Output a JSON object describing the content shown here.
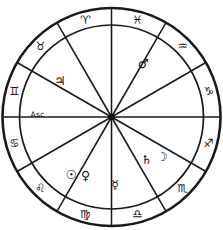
{
  "diagram": {
    "type": "zodiac-wheel",
    "center": {
      "x": 111.5,
      "y": 117,
      "hub_radius": 3.2
    },
    "radii": {
      "outer": 109,
      "inner_ring": 92,
      "sign_label": 100.5
    },
    "house_count": 12,
    "sign_count": 12,
    "colors": {
      "stroke": "#1a1a1a",
      "fill": "#ffffff",
      "glyph": "#111111"
    },
    "ring_rotation_offset_deg": 15
  },
  "signs": [
    {
      "name": "Pisces",
      "glyph": "♓",
      "angle_deg": -75,
      "label_angle_deg": -75
    },
    {
      "name": "Aquarius",
      "glyph": "♒",
      "angle_deg": -45,
      "label_angle_deg": -45
    },
    {
      "name": "Capricorn",
      "glyph": "♑",
      "angle_deg": -15,
      "label_angle_deg": -15
    },
    {
      "name": "Sagittarius",
      "glyph": "♐",
      "angle_deg": 15,
      "label_angle_deg": 15
    },
    {
      "name": "Scorpio",
      "glyph": "♏",
      "angle_deg": 45,
      "label_angle_deg": 45
    },
    {
      "name": "Libra",
      "glyph": "♎",
      "angle_deg": 75,
      "label_angle_deg": 75
    },
    {
      "name": "Virgo",
      "glyph": "♍",
      "angle_deg": 105,
      "label_angle_deg": 105
    },
    {
      "name": "Leo",
      "glyph": "♌",
      "angle_deg": 135,
      "label_angle_deg": 135
    },
    {
      "name": "Cancer",
      "glyph": "♋",
      "angle_deg": 165,
      "label_angle_deg": 165
    },
    {
      "name": "Gemini",
      "glyph": "♊",
      "angle_deg": 195,
      "label_angle_deg": 195
    },
    {
      "name": "Taurus",
      "glyph": "♉",
      "angle_deg": 225,
      "label_angle_deg": 225
    },
    {
      "name": "Aries",
      "glyph": "♈",
      "angle_deg": 255,
      "label_angle_deg": 255
    }
  ],
  "planets": [
    {
      "name": "Mars",
      "glyph": "♂",
      "angle_deg": -59,
      "radius": 62
    },
    {
      "name": "Moon",
      "glyph": "☽",
      "angle_deg": 38,
      "radius": 64
    },
    {
      "name": "Saturn",
      "glyph": "♄",
      "angle_deg": 50,
      "radius": 55
    },
    {
      "name": "Mercury",
      "glyph": "☿",
      "angle_deg": 87,
      "radius": 68
    },
    {
      "name": "Venus",
      "glyph": "♀",
      "angle_deg": 114,
      "radius": 64
    },
    {
      "name": "Sun",
      "glyph": "☉",
      "angle_deg": 125,
      "radius": 70
    },
    {
      "name": "Jupiter",
      "glyph": "♃",
      "angle_deg": 215,
      "radius": 63
    }
  ],
  "points": [
    {
      "name": "Ascendant",
      "label": "Asc",
      "angle_deg": 182,
      "radius": 74
    }
  ]
}
